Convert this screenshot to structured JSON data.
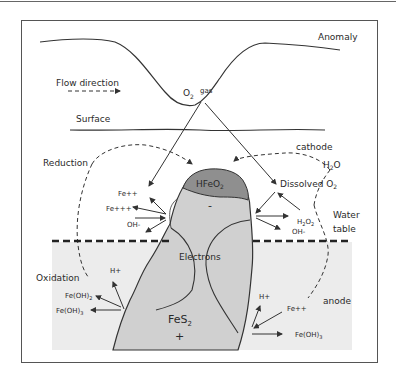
{
  "diagram": {
    "type": "electrochemical-cell-model",
    "labels": {
      "anomaly": "Anomaly",
      "flow_direction": "Flow direction",
      "o2": "O",
      "o2_sub": "2",
      "gas": "gas",
      "surface": "Surface",
      "cathode": "cathode",
      "h2o_h": "H",
      "h2o_sub": "2",
      "h2o_o": "O",
      "reduction": "Reduction",
      "dissolved": "Dissolved O",
      "dissolved_sub": "2",
      "hfeo_a": "HFeO",
      "hfeo_sub": "2",
      "minus": "-",
      "fe_pp_left": "Fe++",
      "fe_ppp_left": "Fe+++",
      "oh_left": "OH-",
      "h2o2_h": "H",
      "h2o2_sub1": "2",
      "h2o2_o": "O",
      "h2o2_sub2": "2",
      "oh_right": "OH-",
      "water": "Water",
      "table": "table",
      "electrons": "Electrons",
      "oxidation": "Oxidation",
      "h_plus_left": "H+",
      "feoh2_left": "Fe(OH)",
      "feoh2_sub": "2",
      "feoh3_left": "Fe(OH)",
      "feoh3_sub": "3",
      "fes2_a": "FeS",
      "fes2_sub": "2",
      "plus": "+",
      "h_plus_right": "H+",
      "fe_pp_right": "Fe++",
      "anode": "anode",
      "feoh3_right": "Fe(OH)",
      "feoh3_right_sub": "3"
    },
    "colors": {
      "frame": "#555555",
      "line": "#333333",
      "groundwater": "#ebebeb",
      "orebody": "#cfcfcf",
      "hfeo2_cap": "#8c8c8c"
    }
  }
}
